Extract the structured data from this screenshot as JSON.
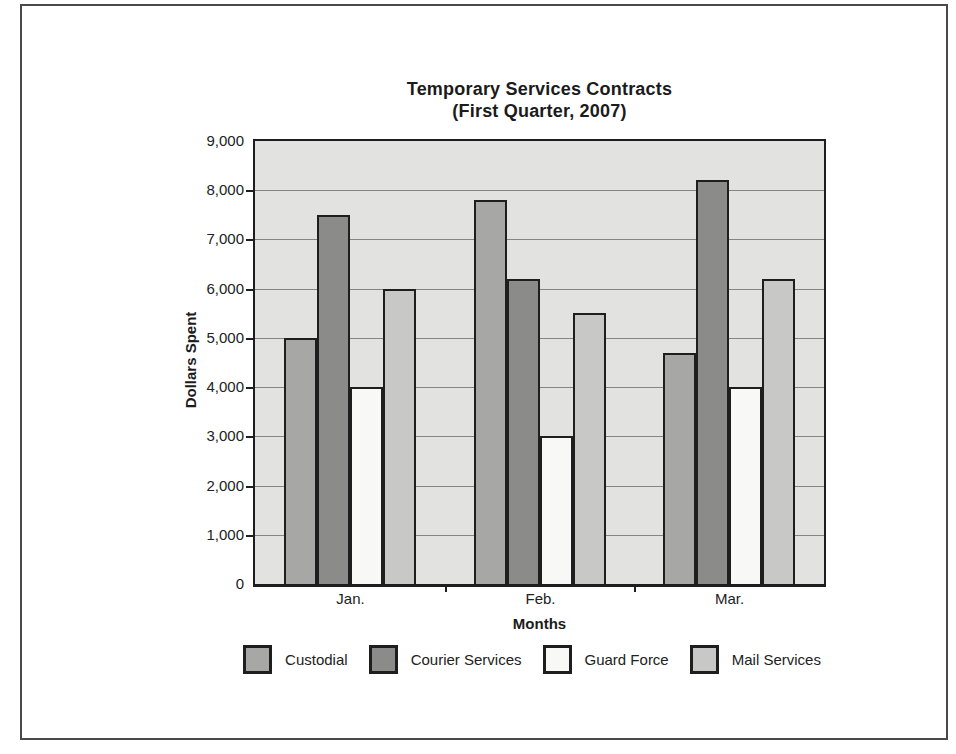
{
  "chart_data": {
    "type": "bar",
    "title": "Temporary Services Contracts",
    "subtitle": "(First Quarter, 2007)",
    "xlabel": "Months",
    "ylabel": "Dollars Spent",
    "categories": [
      "Jan.",
      "Feb.",
      "Mar."
    ],
    "series": [
      {
        "name": "Custodial",
        "color": "#a7a7a5",
        "values": [
          5000,
          7800,
          4700
        ]
      },
      {
        "name": "Courier Services",
        "color": "#8b8b89",
        "values": [
          7500,
          6200,
          8200
        ]
      },
      {
        "name": "Guard Force",
        "color": "#f8f8f6",
        "values": [
          4000,
          3000,
          4000
        ]
      },
      {
        "name": "Mail Services",
        "color": "#c8c8c6",
        "values": [
          6000,
          5500,
          6200
        ]
      }
    ],
    "ylim": [
      0,
      9000
    ],
    "ytick_step": 1000,
    "ytick_labels": [
      "0",
      "1,000",
      "2,000",
      "3,000",
      "4,000",
      "5,000",
      "6,000",
      "7,000",
      "8,000",
      "9,000"
    ],
    "grid": true,
    "legend_position": "bottom",
    "colors": {
      "plot_background": "#e2e2e0",
      "gridline": "#858583",
      "axis_and_borders": "#1e1e1e",
      "frame_border": "#4a4a4a",
      "text": "#1b1b1b"
    }
  }
}
